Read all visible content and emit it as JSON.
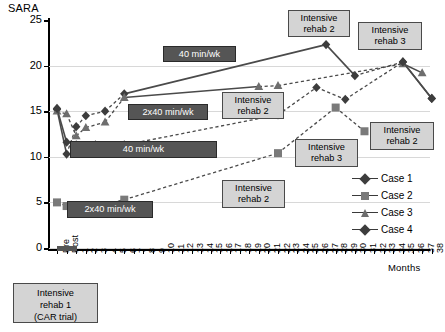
{
  "chart_data": {
    "type": "line",
    "title": "",
    "ylabel": "SARA",
    "xlabel": "Months",
    "ylim": [
      0,
      25
    ],
    "yticks": [
      "25",
      "20",
      "15",
      "10",
      "5",
      "0"
    ],
    "grid": true,
    "legend_position": "right",
    "xcategories": [
      "Pre",
      "Post",
      "1",
      "2",
      "3",
      "4",
      "5",
      "6",
      "7",
      "8",
      "9",
      "10",
      "11",
      "12",
      "13",
      "14",
      "15",
      "16",
      "17",
      "18",
      "19",
      "20",
      "21",
      "22",
      "23",
      "24",
      "25",
      "26",
      "27",
      "28",
      "29",
      "30",
      "31",
      "32",
      "33",
      "34",
      "35",
      "36",
      "37",
      "38"
    ],
    "series": [
      {
        "name": "Case 1",
        "marker": "diamond",
        "color": "#3d3d3d",
        "points": [
          {
            "x": "Pre",
            "y": 15.2
          },
          {
            "x": "Post",
            "y": 10.3
          },
          {
            "x": "1",
            "y": 13.3
          },
          {
            "x": "2",
            "y": 14.5
          },
          {
            "x": "4",
            "y": 15.0
          },
          {
            "x": "6",
            "y": 16.9
          },
          {
            "x": "27",
            "y": 22.3
          },
          {
            "x": "30",
            "y": 18.9
          },
          {
            "x": "35",
            "y": 20.4
          },
          {
            "x": "38",
            "y": 16.4
          }
        ]
      },
      {
        "name": "Case 2",
        "marker": "square",
        "color": "#7a7a7a",
        "points": [
          {
            "x": "Pre",
            "y": 5.0
          },
          {
            "x": "Post",
            "y": 4.6
          },
          {
            "x": "1",
            "y": 4.6
          },
          {
            "x": "3",
            "y": 4.5
          },
          {
            "x": "6",
            "y": 5.3
          },
          {
            "x": "22",
            "y": 10.4
          },
          {
            "x": "28",
            "y": 15.4
          },
          {
            "x": "31",
            "y": 12.8
          }
        ]
      },
      {
        "name": "Case 3",
        "marker": "triangle",
        "color": "#6e6e6e",
        "points": [
          {
            "x": "Pre",
            "y": 15.0
          },
          {
            "x": "Post",
            "y": 14.7
          },
          {
            "x": "1",
            "y": 12.3
          },
          {
            "x": "2",
            "y": 13.2
          },
          {
            "x": "4",
            "y": 13.8
          },
          {
            "x": "6",
            "y": 16.5
          },
          {
            "x": "20",
            "y": 17.7
          },
          {
            "x": "22",
            "y": 17.8
          },
          {
            "x": "35",
            "y": 20.2
          },
          {
            "x": "37",
            "y": 19.2
          }
        ]
      },
      {
        "name": "Case 4",
        "marker": "diamond",
        "color": "#3d3d3d",
        "points": [
          {
            "x": "Pre",
            "y": 15.3
          },
          {
            "x": "Post",
            "y": 11.6
          },
          {
            "x": "1",
            "y": 11.3
          },
          {
            "x": "3",
            "y": 11.3
          },
          {
            "x": "6",
            "y": 11.3
          },
          {
            "x": "22",
            "y": 14.6
          },
          {
            "x": "26",
            "y": 17.6
          },
          {
            "x": "29",
            "y": 16.3
          },
          {
            "x": "35",
            "y": 20.4
          },
          {
            "x": "38",
            "y": 16.4
          }
        ]
      }
    ],
    "annotations": [
      {
        "id": "note-40minwk-top",
        "text": "40 min/wk",
        "style": "dark"
      },
      {
        "id": "note-2x40minwk-mid",
        "text": "2x40 min/wk",
        "style": "dark"
      },
      {
        "id": "note-40minwk-mid",
        "text": "40 min/wk",
        "style": "dark"
      },
      {
        "id": "note-2x40minwk-low",
        "text": "2x40 min/wk",
        "style": "dark"
      },
      {
        "id": "note-rehab2-mid",
        "text": "Intensive\nrehab 2",
        "style": "light"
      },
      {
        "id": "note-rehab2-top",
        "text": "Intensive\nrehab 2",
        "style": "light"
      },
      {
        "id": "note-rehab3-top",
        "text": "Intensive\nrehab 3",
        "style": "light"
      },
      {
        "id": "note-rehab2-right",
        "text": "Intensive\nrehab 2",
        "style": "light"
      },
      {
        "id": "note-rehab3-low",
        "text": "Intensive\nrehab 3",
        "style": "light"
      },
      {
        "id": "note-rehab2-bottom",
        "text": "Intensive\nrehab 2",
        "style": "light"
      },
      {
        "id": "note-rehab1",
        "text": "Intensive\nrehab 1\n(CAR trial)",
        "style": "light"
      }
    ]
  }
}
